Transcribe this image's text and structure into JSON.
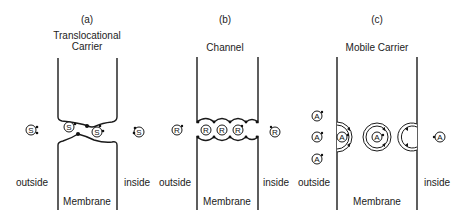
{
  "panels": [
    {
      "id": "a",
      "letter": "(a)",
      "title_line1": "Translocational",
      "title_line2": "Carrier",
      "molecule": "S",
      "outside_label": "outside",
      "inside_label": "inside",
      "membrane_label": "Membrane"
    },
    {
      "id": "b",
      "letter": "(b)",
      "title_line1": "Channel",
      "molecule": "R",
      "outside_label": "outside",
      "inside_label": "inside",
      "membrane_label": "Membrane"
    },
    {
      "id": "c",
      "letter": "(c)",
      "title_line1": "Mobile Carrier",
      "molecule": "A",
      "outside_label": "outside",
      "inside_label": "inside",
      "membrane_label": "Membrane"
    }
  ],
  "colors": {
    "line": "#1a1a1a",
    "text": "#222222",
    "background": "#ffffff"
  }
}
